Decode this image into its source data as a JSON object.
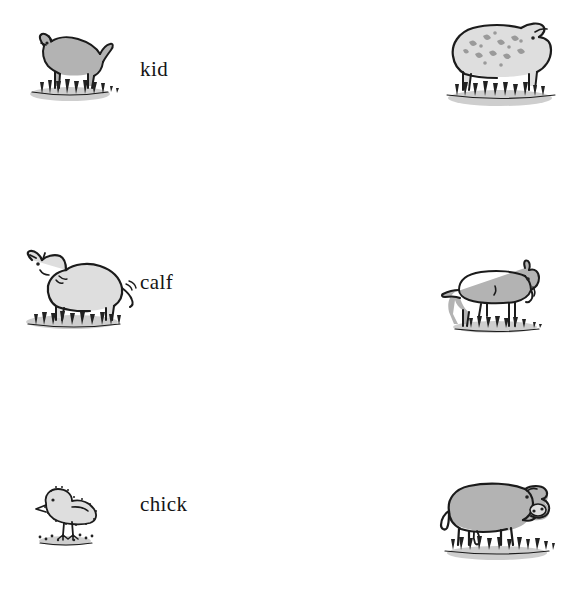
{
  "page": {
    "background_color": "#ffffff",
    "text_color": "#141414",
    "columns": 3,
    "column_roles": [
      "baby-animal-picture",
      "baby-animal-word",
      "adult-animal-picture"
    ]
  },
  "rows": [
    {
      "index": 1,
      "label": "kid",
      "baby": {
        "name": "kid",
        "species": "goat",
        "icon": "baby-goat-icon"
      },
      "adult": {
        "name": "sheep",
        "species": "sheep",
        "icon": "sheep-icon"
      }
    },
    {
      "index": 2,
      "label": "calf",
      "baby": {
        "name": "calf",
        "species": "cow",
        "icon": "baby-cow-icon"
      },
      "adult": {
        "name": "goat",
        "species": "goat",
        "icon": "goat-icon"
      }
    },
    {
      "index": 3,
      "label": "chick",
      "baby": {
        "name": "chick",
        "species": "chicken",
        "icon": "chick-icon"
      },
      "adult": {
        "name": "cow",
        "species": "cow",
        "icon": "cow-icon"
      }
    },
    {
      "index": 4,
      "label": "foal",
      "baby": {
        "name": "foal",
        "species": "horse",
        "icon": "foal-icon"
      },
      "adult": {
        "name": "horse",
        "species": "horse",
        "icon": "horse-icon"
      }
    },
    {
      "index": 5,
      "label": "lamb",
      "baby": {
        "name": "lamb",
        "species": "sheep",
        "icon": "lamb-icon"
      },
      "adult": {
        "name": "hen",
        "species": "chicken",
        "icon": "hen-icon"
      }
    }
  ],
  "colors": {
    "ink": "#1b1b1b",
    "body_fill": "#b3b3b3",
    "body_fill_light": "#dedede",
    "grass": "#a8a8a8",
    "background": "#ffffff"
  }
}
